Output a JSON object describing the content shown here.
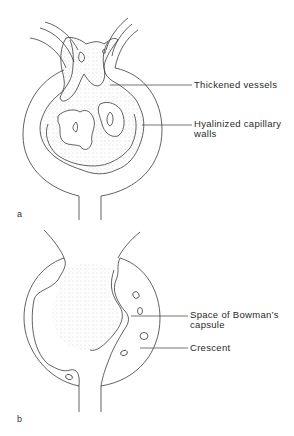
{
  "figure": {
    "panels": [
      {
        "id": "a",
        "letter": "a",
        "labels": [
          {
            "text": "Thickened vessels",
            "lines": [
              "Thickened vessels"
            ]
          },
          {
            "text": "Hyalinized capillary walls",
            "lines": [
              "Hyalinized capillary",
              "walls"
            ]
          }
        ]
      },
      {
        "id": "b",
        "letter": "b",
        "labels": [
          {
            "text": "Space of Bowman's capsule",
            "lines": [
              "Space of Bowman’s",
              "capsule"
            ]
          },
          {
            "text": "Crescent",
            "lines": [
              "Crescent"
            ]
          }
        ]
      }
    ]
  },
  "colors": {
    "line": "#3a3a3a",
    "stipple": "#b8b8b8",
    "background": "#ffffff"
  }
}
